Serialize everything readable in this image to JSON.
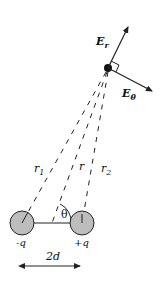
{
  "diagram": {
    "type": "electric dipole field geometry",
    "point": {
      "field_radial_label": "E",
      "field_radial_sub": "r",
      "field_theta_label": "E",
      "field_theta_sub": "θ"
    },
    "distances": {
      "r1_main": "r",
      "r1_sub": "1",
      "r_label": "r",
      "r2_main": "r",
      "r2_sub": "2"
    },
    "angle_label": "θ",
    "charges": {
      "negative": "-q",
      "positive": "+q"
    },
    "separation_label": "2d",
    "colors": {
      "sphere_fill": "#bdbdbd",
      "line": "#222222",
      "background": "#ffffff"
    }
  }
}
